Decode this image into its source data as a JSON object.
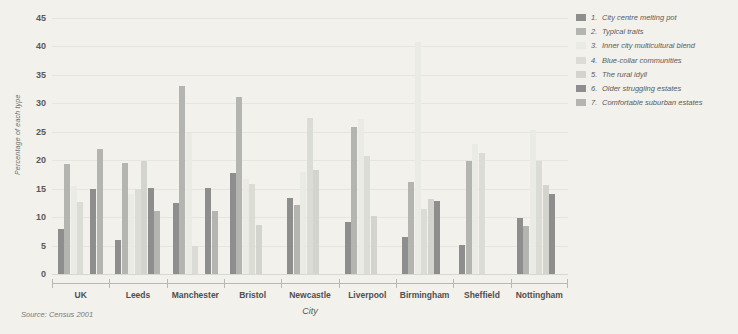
{
  "source": "Source: Census 2001",
  "legend": {
    "items": [
      {
        "num": "1.",
        "label": "City centre melting pot",
        "color": "#8e8e8e"
      },
      {
        "num": "2.",
        "label": "Typical traits",
        "color": "#b4b4b0"
      },
      {
        "num": "3.",
        "label": "Inner city multicultural blend",
        "color": "#ebebe6"
      },
      {
        "num": "4.",
        "label": "Blue-collar communities",
        "color": "#dcdcd7"
      },
      {
        "num": "5.",
        "label": "The rural idyll",
        "color": "#d4d4cf"
      },
      {
        "num": "6.",
        "label": "Older struggling estates",
        "color": "#8e8e8e"
      },
      {
        "num": "7.",
        "label": "Comfortable suburban estates",
        "color": "#b4b4b0"
      }
    ]
  },
  "chart_data": {
    "type": "bar",
    "title": "",
    "xlabel": "City",
    "ylabel": "Percentage of each type",
    "ylim": [
      0,
      45
    ],
    "yticks": [
      0,
      5,
      10,
      15,
      20,
      25,
      30,
      35,
      40,
      45
    ],
    "grid": true,
    "legend_position": "right",
    "categories": [
      "UK",
      "Leeds",
      "Manchester",
      "Bristol",
      "Newcastle",
      "Liverpool",
      "Birmingham",
      "Sheffield",
      "Nottingham"
    ],
    "series": [
      {
        "name": "City centre melting pot",
        "color": "#8e8e8e",
        "values": [
          8.0,
          6.0,
          15.1,
          17.8,
          13.3,
          27.5,
          6.5,
          5.1,
          9.8
        ]
      },
      {
        "name": "Typical traits",
        "color": "#b4b4b0",
        "values": [
          19.4,
          19.5,
          11.0,
          31.2,
          12.1,
          18.3,
          16.2,
          19.8,
          8.4
        ]
      },
      {
        "name": "Inner city multicultural blend",
        "color": "#ebebe6",
        "values": [
          15.4,
          14.0,
          12.4,
          16.7,
          18.0,
          9.2,
          40.7,
          22.9,
          25.4
        ]
      },
      {
        "name": "Blue-collar communities",
        "color": "#dcdcd7",
        "values": [
          12.6,
          15.0,
          33.0,
          15.9,
          25.8,
          11.5,
          13.1,
          21.3,
          19.8
        ]
      },
      {
        "name": "The rural idyll",
        "color": "#d4d4cf",
        "values": [
          0.0,
          19.8,
          24.8,
          8.6,
          27.2,
          12.9,
          0.0,
          0.0,
          0.0
        ]
      },
      {
        "name": "Older struggling estates",
        "color": "#8e8e8e",
        "values": [
          14.9,
          15.2,
          5.0,
          0.0,
          20.8,
          10.2,
          0.0,
          19.6,
          15.6
        ]
      },
      {
        "name": "Comfortable suburban estates",
        "color": "#b4b4b0",
        "values": [
          22.0,
          11.0,
          0.0,
          0.0,
          0.0,
          0.0,
          0.0,
          0.0,
          14.0
        ]
      }
    ],
    "groups": [
      {
        "city": "UK",
        "bars": [
          8.0,
          19.4,
          15.4,
          12.6,
          0.0,
          14.9,
          22.0
        ]
      },
      {
        "city": "Leeds",
        "bars": [
          6.0,
          19.5,
          14.0,
          15.0,
          19.8,
          15.2,
          11.0
        ]
      },
      {
        "city": "Manchester",
        "bars": [
          12.4,
          33.0,
          24.8,
          5.0,
          0.0,
          15.1,
          11.0
        ]
      },
      {
        "city": "Bristol",
        "bars": [
          17.8,
          31.2,
          16.7,
          15.9,
          8.6,
          0.0,
          0.0
        ]
      },
      {
        "city": "Newcastle",
        "bars": [
          13.3,
          12.1,
          18.0,
          27.5,
          18.3,
          0.0,
          0.0
        ]
      },
      {
        "city": "Liverpool",
        "bars": [
          9.2,
          25.8,
          27.2,
          20.8,
          10.2,
          0.0,
          0.0
        ]
      },
      {
        "city": "Birmingham",
        "bars": [
          6.5,
          16.2,
          40.7,
          11.5,
          13.1,
          12.9,
          0.0
        ]
      },
      {
        "city": "Sheffield",
        "bars": [
          5.1,
          19.8,
          22.9,
          21.3,
          0.0,
          0.0,
          0.0
        ]
      },
      {
        "city": "Nottingham",
        "bars": [
          9.8,
          8.4,
          25.4,
          19.8,
          15.6,
          14.0,
          0.0
        ]
      }
    ]
  }
}
